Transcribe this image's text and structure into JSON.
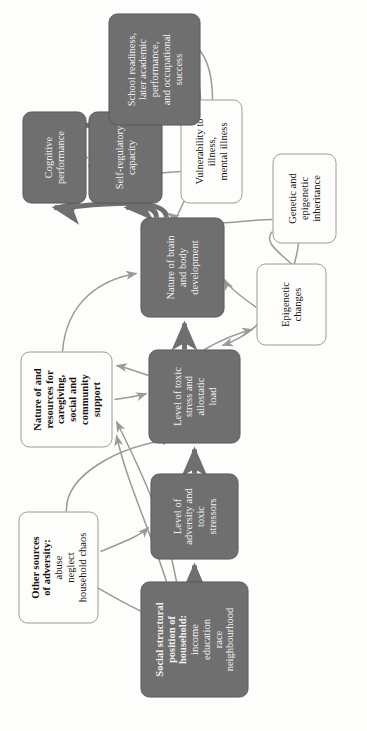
{
  "diagram": {
    "orientation": "rotated-90-ccw",
    "colors": {
      "dark_node_fill": "#6f6f6f",
      "dark_node_text": "#f2f2f0",
      "light_node_fill": "#fdfdfc",
      "light_node_text": "#16130f",
      "light_node_border": "#9a9a98",
      "thick_arrow": "#6f6f6f",
      "thin_arrow": "#9a9a98",
      "background": "#fdfdfc"
    },
    "nodes": [
      {
        "id": "social_structural_position",
        "style": "dark",
        "title": "Social structural position of household:",
        "title_lines": [
          "Social structural",
          "position of",
          "household:"
        ],
        "sub_lines": [
          "income",
          "education",
          "race",
          "neighbourhood"
        ]
      },
      {
        "id": "other_sources_adversity",
        "style": "light",
        "title": "Other sources of adversity:",
        "title_lines": [
          "Other sources",
          "of adversity:"
        ],
        "sub_lines": [
          "abuse",
          "neglect",
          "household chaos"
        ]
      },
      {
        "id": "level_adversity_toxic_stressors",
        "style": "dark",
        "title": "Level of adversity and toxic stressors",
        "title_lines": [],
        "sub_lines": [
          "Level of",
          "adversity and",
          "toxic",
          "stressors"
        ]
      },
      {
        "id": "level_toxic_stress_allostatic_load",
        "style": "dark",
        "title": "Level of toxic stress and allostatic load",
        "title_lines": [],
        "sub_lines": [
          "Level of toxic",
          "stress and",
          "allostatic",
          "load"
        ]
      },
      {
        "id": "caregiving_social_community_support",
        "style": "light",
        "title": "Nature of and resources for caregiving, social and community support",
        "title_lines": [
          "Nature of and",
          "resources for",
          "caregiving,",
          "social and",
          "community",
          "support"
        ],
        "sub_lines": []
      },
      {
        "id": "epigenetic_changes",
        "style": "light",
        "title": "Epigenetic changes",
        "title_lines": [],
        "sub_lines": [
          "Epigenetic",
          "changes"
        ]
      },
      {
        "id": "genetic_epigenetic_inheritance",
        "style": "light",
        "title": "Genetic and epigenetic inheritance",
        "title_lines": [],
        "sub_lines": [
          "Genetic and",
          "epigenetic",
          "inheritance"
        ]
      },
      {
        "id": "nature_brain_body_development",
        "style": "dark",
        "title": "Nature of brain and body development",
        "title_lines": [],
        "sub_lines": [
          "Nature of brain",
          "and body",
          "development"
        ]
      },
      {
        "id": "vulnerability_illness",
        "style": "light",
        "title": "Vulnerability to illness, mental illness",
        "title_lines": [],
        "sub_lines": [
          "Vulnerability to illness,",
          "mental illness"
        ]
      },
      {
        "id": "self_regulatory_capacity",
        "style": "dark",
        "title": "Self-regulatory capacity",
        "title_lines": [],
        "sub_lines": [
          "Self-regulatory",
          "capacity"
        ]
      },
      {
        "id": "cognitive_performance",
        "style": "dark",
        "title": "Cognitive performance",
        "title_lines": [],
        "sub_lines": [
          "Cognitive",
          "performance"
        ]
      },
      {
        "id": "school_readiness_outcomes",
        "style": "dark",
        "title": "School readiness, later academic performance, and occupational success",
        "title_lines": [],
        "sub_lines": [
          "School readiness,",
          "later academic",
          "performance,",
          "and occupational",
          "success"
        ]
      }
    ],
    "edges": [
      {
        "from": "social_structural_position",
        "to": "level_adversity_toxic_stressors",
        "weight": "thick"
      },
      {
        "from": "social_structural_position",
        "to": "other_sources_adversity",
        "weight": "thin"
      },
      {
        "from": "social_structural_position",
        "to": "caregiving_social_community_support",
        "weight": "thin"
      },
      {
        "from": "other_sources_adversity",
        "to": "level_adversity_toxic_stressors",
        "weight": "thin"
      },
      {
        "from": "other_sources_adversity",
        "to": "level_toxic_stress_allostatic_load",
        "weight": "thin"
      },
      {
        "from": "level_adversity_toxic_stressors",
        "to": "level_toxic_stress_allostatic_load",
        "weight": "thick"
      },
      {
        "from": "caregiving_social_community_support",
        "to": "level_toxic_stress_allostatic_load",
        "weight": "thin"
      },
      {
        "from": "caregiving_social_community_support",
        "to": "nature_brain_body_development",
        "weight": "thin"
      },
      {
        "from": "level_toxic_stress_allostatic_load",
        "to": "nature_brain_body_development",
        "weight": "thick"
      },
      {
        "from": "level_toxic_stress_allostatic_load",
        "to": "epigenetic_changes",
        "weight": "thin"
      },
      {
        "from": "level_toxic_stress_allostatic_load",
        "to": "caregiving_social_community_support",
        "weight": "thin"
      },
      {
        "from": "genetic_epigenetic_inheritance",
        "to": "level_toxic_stress_allostatic_load",
        "weight": "thin"
      },
      {
        "from": "genetic_epigenetic_inheritance",
        "to": "epigenetic_changes",
        "weight": "thin"
      },
      {
        "from": "genetic_epigenetic_inheritance",
        "to": "nature_brain_body_development",
        "weight": "thin"
      },
      {
        "from": "epigenetic_changes",
        "to": "nature_brain_body_development",
        "weight": "thin"
      },
      {
        "from": "nature_brain_body_development",
        "to": "self_regulatory_capacity",
        "weight": "thick"
      },
      {
        "from": "nature_brain_body_development",
        "to": "cognitive_performance",
        "weight": "thick"
      },
      {
        "from": "nature_brain_body_development",
        "to": "vulnerability_illness",
        "weight": "thin"
      },
      {
        "from": "self_regulatory_capacity",
        "to": "cognitive_performance",
        "weight": "thin"
      },
      {
        "from": "self_regulatory_capacity",
        "to": "school_readiness_outcomes",
        "weight": "thick"
      },
      {
        "from": "cognitive_performance",
        "to": "school_readiness_outcomes",
        "weight": "thick"
      },
      {
        "from": "vulnerability_illness",
        "to": "cognitive_performance",
        "weight": "thin"
      },
      {
        "from": "vulnerability_illness",
        "to": "school_readiness_outcomes",
        "weight": "thin"
      }
    ]
  }
}
